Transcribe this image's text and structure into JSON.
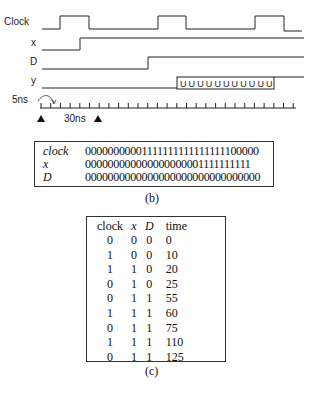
{
  "timing_diagram": {
    "signals": [
      {
        "name": "Clock"
      },
      {
        "name": "x"
      },
      {
        "name": "D"
      },
      {
        "name": "y",
        "unknown_symbol": "U",
        "unknown_count": 11
      }
    ],
    "axis": {
      "tick_label": "5ns",
      "span_label": "30ns"
    }
  },
  "panel_b": {
    "caption": "(b)",
    "rows": [
      {
        "name": "clock",
        "bits": "00000000001111111111111111100000"
      },
      {
        "name": "x",
        "bits": "000000000000000000001111111111"
      },
      {
        "name": "D",
        "bits": "0000000000000000000000000000000"
      }
    ]
  },
  "panel_c": {
    "caption": "(c)",
    "headers": [
      "clock",
      "x",
      "D",
      "time"
    ],
    "rows": [
      [
        "0",
        "0",
        "0",
        "0"
      ],
      [
        "1",
        "0",
        "0",
        "10"
      ],
      [
        "1",
        "1",
        "0",
        "20"
      ],
      [
        "0",
        "1",
        "0",
        "25"
      ],
      [
        "0",
        "1",
        "1",
        "55"
      ],
      [
        "1",
        "1",
        "1",
        "60"
      ],
      [
        "0",
        "1",
        "1",
        "75"
      ],
      [
        "1",
        "1",
        "1",
        "110"
      ],
      [
        "0",
        "1",
        "1",
        "125"
      ]
    ]
  }
}
